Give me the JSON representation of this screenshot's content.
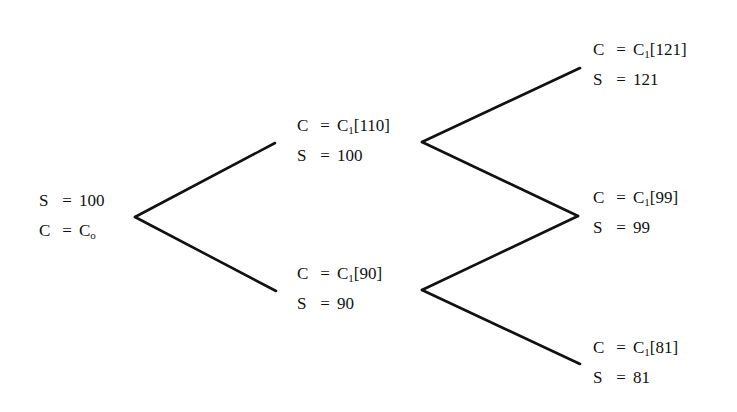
{
  "diagram": {
    "type": "binomial-tree",
    "steps": 2,
    "edge_color": "#111111",
    "nodes": {
      "root": {
        "lines": [
          {
            "var": "S",
            "eq": "=",
            "val": "100",
            "sub": "",
            "bracket": ""
          },
          {
            "var": "C",
            "eq": "=",
            "val": "C",
            "sub": "o",
            "bracket": ""
          }
        ]
      },
      "up": {
        "lines": [
          {
            "var": "C",
            "eq": "=",
            "val": "C",
            "sub": "1",
            "bracket": "[110]"
          },
          {
            "var": "S",
            "eq": "=",
            "val": "100",
            "sub": "",
            "bracket": ""
          }
        ]
      },
      "down": {
        "lines": [
          {
            "var": "C",
            "eq": "=",
            "val": "C",
            "sub": "1",
            "bracket": "[90]"
          },
          {
            "var": "S",
            "eq": "=",
            "val": "90",
            "sub": "",
            "bracket": ""
          }
        ]
      },
      "up_up": {
        "lines": [
          {
            "var": "C",
            "eq": "=",
            "val": "C",
            "sub": "1",
            "bracket": "[121]"
          },
          {
            "var": "S",
            "eq": "=",
            "val": "121",
            "sub": "",
            "bracket": ""
          }
        ]
      },
      "up_down": {
        "lines": [
          {
            "var": "C",
            "eq": "=",
            "val": "C",
            "sub": "1",
            "bracket": "[99]"
          },
          {
            "var": "S",
            "eq": "=",
            "val": "99",
            "sub": "",
            "bracket": ""
          }
        ]
      },
      "down_down": {
        "lines": [
          {
            "var": "C",
            "eq": "=",
            "val": "C",
            "sub": "1",
            "bracket": "[81]"
          },
          {
            "var": "S",
            "eq": "=",
            "val": "81",
            "sub": "",
            "bracket": ""
          }
        ]
      }
    },
    "edges": [
      {
        "from": "root",
        "to": "up"
      },
      {
        "from": "root",
        "to": "down"
      },
      {
        "from": "up",
        "to": "up_up"
      },
      {
        "from": "up",
        "to": "up_down"
      },
      {
        "from": "down",
        "to": "up_down"
      },
      {
        "from": "down",
        "to": "down_down"
      }
    ]
  }
}
